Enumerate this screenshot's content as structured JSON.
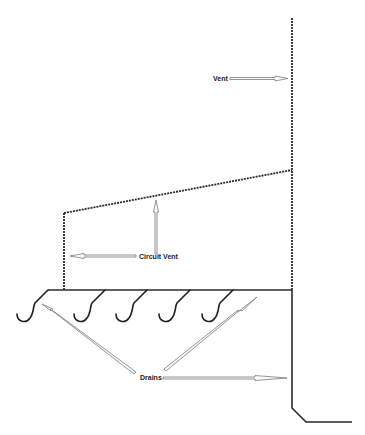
{
  "diagram": {
    "type": "plumbing-venting",
    "labels": {
      "vent": "Vent",
      "circuit_vent": "Circuit Vent",
      "drains": "Drains"
    },
    "trap_count": 5,
    "colors": {
      "line": "#2a2a2a",
      "arrow_outline": "#7a7a7a",
      "background": "#ffffff"
    }
  }
}
